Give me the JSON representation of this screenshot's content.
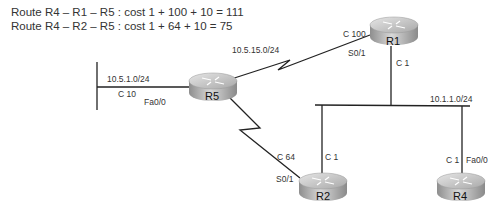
{
  "header": {
    "line1": "Route R4  – R1 – R5 : cost 1 + 100 + 10 = 111",
    "line2": "Route R4  – R2 – R5 : cost 1 + 64 + 10 = 75"
  },
  "routers": {
    "r1": {
      "name": "R1"
    },
    "r2": {
      "name": "R2"
    },
    "r4": {
      "name": "R4"
    },
    "r5": {
      "name": "R5"
    }
  },
  "labels": {
    "subnet_r5_lan": "10.5.1.0/24",
    "r5_lan_cost": "C 10",
    "r5_lan_iface": "Fa0/0",
    "subnet_r5_r1": "10.5.15.0/24",
    "r1_serial_cost": "C 100",
    "r1_serial_iface": "S0/1",
    "r1_lan_cost": "C 1",
    "subnet_lan": "10.1.1.0/24",
    "r2_serial_cost": "C 64",
    "r2_serial_iface": "S0/1",
    "r2_lan_cost": "C 1",
    "r4_lan_cost": "C 1",
    "r4_lan_iface": "Fa0/0"
  },
  "colors": {
    "line": "#222222",
    "router_top": "#c9c9c9",
    "router_side": "#9a9a9a"
  }
}
